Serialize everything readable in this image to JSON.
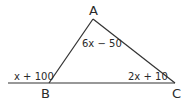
{
  "diagram": {
    "type": "triangle",
    "vertices": {
      "A": {
        "label": "A",
        "x": 93,
        "y": 19
      },
      "B": {
        "label": "B",
        "x": 49,
        "y": 83
      },
      "C": {
        "label": "C",
        "x": 175,
        "y": 83
      }
    },
    "baseline": {
      "x1": 8,
      "x2": 175,
      "y": 83
    },
    "angles": {
      "A": {
        "expr": "6x − 50",
        "kind": "interior"
      },
      "B": {
        "expr": "x + 100",
        "kind": "exterior"
      },
      "C": {
        "expr": "2x + 10",
        "kind": "interior"
      }
    },
    "line_color": "#333333"
  }
}
